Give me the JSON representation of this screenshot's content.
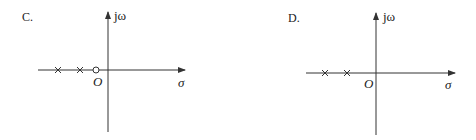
{
  "panels": [
    {
      "option": "C.",
      "axes": {
        "imag_label": "jω",
        "real_label": "σ",
        "origin_label": "O"
      },
      "poles": [
        {
          "marker": "×",
          "x": 58
        },
        {
          "marker": "×",
          "x": 80
        }
      ],
      "zeros": [
        {
          "marker": "○",
          "x": 96
        }
      ]
    },
    {
      "option": "D.",
      "axes": {
        "imag_label": "jω",
        "real_label": "σ",
        "origin_label": "O"
      },
      "poles": [
        {
          "marker": "×",
          "x": 325
        },
        {
          "marker": "×",
          "x": 347
        }
      ],
      "zeros": []
    }
  ],
  "colors": {
    "line": "#333333",
    "background": "#ffffff"
  }
}
